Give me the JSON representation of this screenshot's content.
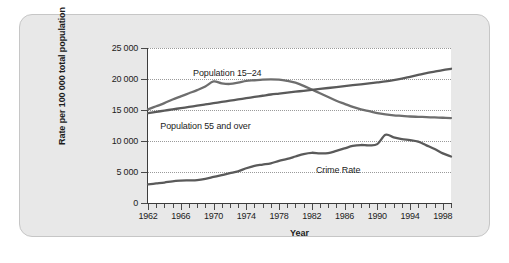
{
  "chart_data": {
    "type": "line",
    "title": "",
    "xlabel": "Year",
    "ylabel": "Rate per 100 000 total population",
    "xlim": [
      1962,
      1999
    ],
    "ylim": [
      0,
      25000
    ],
    "grid": true,
    "legend": "inline-labels",
    "ytick_labels": [
      "25 000",
      "20 000",
      "15 000",
      "10 000",
      "5 000",
      "0"
    ],
    "ytick_values": [
      25000,
      20000,
      15000,
      10000,
      5000,
      0
    ],
    "xtick_labels": [
      "1962",
      "1966",
      "1970",
      "1974",
      "1978",
      "1982",
      "1986",
      "1990",
      "1994",
      "1998"
    ],
    "xtick_values": [
      1962,
      1966,
      1970,
      1974,
      1978,
      1982,
      1986,
      1990,
      1994,
      1998
    ],
    "x": [
      1962,
      1963,
      1964,
      1965,
      1966,
      1967,
      1968,
      1969,
      1970,
      1971,
      1972,
      1973,
      1974,
      1975,
      1976,
      1977,
      1978,
      1979,
      1980,
      1981,
      1982,
      1983,
      1984,
      1985,
      1986,
      1987,
      1988,
      1989,
      1990,
      1991,
      1992,
      1993,
      1994,
      1995,
      1996,
      1997,
      1998,
      1999
    ],
    "series": [
      {
        "name": "Population 15–24",
        "color": "#6e6e6e",
        "values": [
          15100,
          15600,
          16100,
          16700,
          17200,
          17700,
          18200,
          18800,
          19600,
          19300,
          19200,
          19400,
          19700,
          19800,
          19900,
          19950,
          19900,
          19700,
          19400,
          18900,
          18300,
          17700,
          17100,
          16500,
          16000,
          15500,
          15100,
          14800,
          14500,
          14300,
          14150,
          14050,
          13950,
          13900,
          13850,
          13800,
          13750,
          13700
        ]
      },
      {
        "name": "Population 55 and over",
        "color": "#5a5a5a",
        "values": [
          14500,
          14700,
          14900,
          15100,
          15300,
          15500,
          15700,
          15900,
          16100,
          16300,
          16500,
          16700,
          16900,
          17100,
          17300,
          17500,
          17650,
          17800,
          17950,
          18100,
          18250,
          18400,
          18550,
          18700,
          18850,
          19000,
          19150,
          19300,
          19450,
          19600,
          19800,
          20050,
          20350,
          20650,
          20950,
          21200,
          21450,
          21650
        ]
      },
      {
        "name": "Crime Rate",
        "color": "#5a5a5a",
        "values": [
          3000,
          3150,
          3300,
          3500,
          3600,
          3650,
          3700,
          3900,
          4200,
          4500,
          4800,
          5100,
          5600,
          6000,
          6200,
          6400,
          6800,
          7100,
          7500,
          7900,
          8100,
          8000,
          8050,
          8400,
          8800,
          9200,
          9350,
          9300,
          9500,
          11000,
          10600,
          10300,
          10150,
          9900,
          9300,
          8700,
          8000,
          7500
        ]
      }
    ],
    "annotations": [
      {
        "text": "Population 15–24",
        "x": 1967.5,
        "y": 21800
      },
      {
        "text": "Population 55 and over",
        "x": 1963.5,
        "y": 13200
      },
      {
        "text": "Crime Rate",
        "x": 1982.5,
        "y": 6100
      }
    ]
  }
}
